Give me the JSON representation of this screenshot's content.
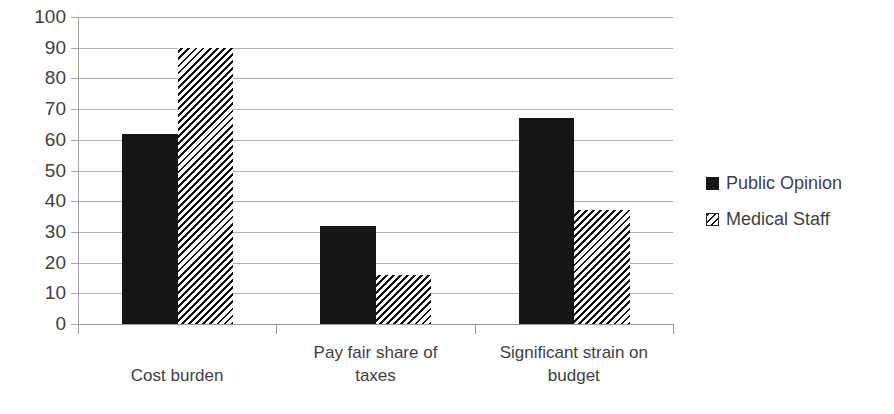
{
  "chart_data": {
    "type": "bar",
    "title": "",
    "xlabel": "",
    "ylabel": "",
    "ylim": [
      0,
      100
    ],
    "yticks": [
      0,
      10,
      20,
      30,
      40,
      50,
      60,
      70,
      80,
      90,
      100
    ],
    "ytick_labels": [
      "0",
      "10",
      "20",
      "30",
      "40",
      "50",
      "60",
      "70",
      "80",
      "90",
      "100"
    ],
    "grid": true,
    "legend_position": "right",
    "categories": [
      "Cost burden",
      "Pay fair share of taxes",
      "Significant strain on budget"
    ],
    "series": [
      {
        "name": "Public Opinion",
        "fill": "solid",
        "color": "#161616",
        "values": [
          62,
          32,
          67
        ]
      },
      {
        "name": "Medical Staff",
        "fill": "diagonal-hatch",
        "color": "#111111",
        "values": [
          90,
          16,
          37
        ]
      }
    ]
  },
  "axis": {
    "grid_color": "#b2b2b2",
    "axis_color": "#9a9a9a",
    "text_color": "#3f3f3f"
  },
  "categories_display": [
    {
      "line1": "Cost burden",
      "line2": ""
    },
    {
      "line1": "Pay fair share of",
      "line2": "taxes"
    },
    {
      "line1": "Significant strain on",
      "line2": "budget"
    }
  ],
  "legend": {
    "items": [
      {
        "label": "Public Opinion"
      },
      {
        "label": "Medical Staff"
      }
    ]
  }
}
